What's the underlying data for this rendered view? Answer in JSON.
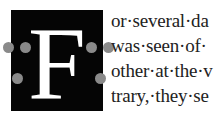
{
  "dropcap": {
    "letter": "F",
    "background": "#050505",
    "color": "#ffffff"
  },
  "handles": [
    {
      "name": "left-outer-top",
      "x": 9,
      "y": 47
    },
    {
      "name": "left-inner-top",
      "x": 25,
      "y": 47
    },
    {
      "name": "left-inner-bottom",
      "x": 17,
      "y": 78
    },
    {
      "name": "right-inner-top",
      "x": 92,
      "y": 47
    },
    {
      "name": "right-outer-top",
      "x": 108,
      "y": 47
    },
    {
      "name": "right-inner-bottom",
      "x": 100,
      "y": 78
    }
  ],
  "text": {
    "lines": [
      "or·several·da",
      "was·seen·of·",
      "other·at·the·v",
      "trary,·they·se"
    ]
  }
}
